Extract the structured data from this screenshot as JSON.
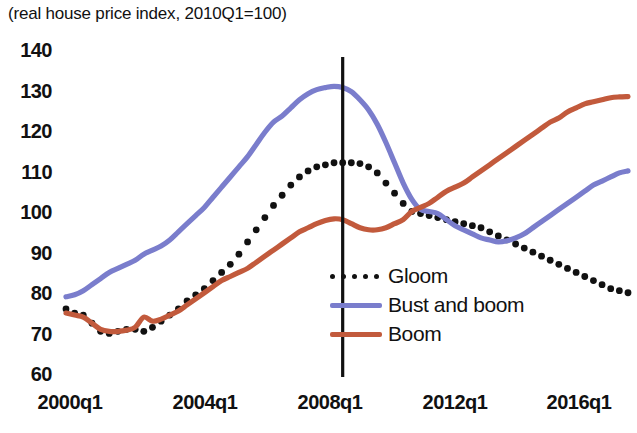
{
  "chart_data": {
    "type": "line",
    "title": "(real house price index, 2010Q1=100)",
    "xlabel": "",
    "ylabel": "",
    "ylim": [
      60,
      140
    ],
    "yticks": [
      140,
      130,
      120,
      110,
      100,
      90,
      80,
      70,
      60
    ],
    "xticks": [
      "2000q1",
      "2004q1",
      "2008q1",
      "2012q1",
      "2016q1"
    ],
    "xlim": [
      "2000q1",
      "2016q4"
    ],
    "grid": false,
    "legend_position": "center-right",
    "annotations": [
      {
        "type": "vline",
        "x": "2008q1",
        "label": "",
        "color": "#111111"
      }
    ],
    "x": [
      "2000q1",
      "2000q2",
      "2000q3",
      "2000q4",
      "2001q1",
      "2001q2",
      "2001q3",
      "2001q4",
      "2002q1",
      "2002q2",
      "2002q3",
      "2002q4",
      "2003q1",
      "2003q2",
      "2003q3",
      "2003q4",
      "2004q1",
      "2004q2",
      "2004q3",
      "2004q4",
      "2005q1",
      "2005q2",
      "2005q3",
      "2005q4",
      "2006q1",
      "2006q2",
      "2006q3",
      "2006q4",
      "2007q1",
      "2007q2",
      "2007q3",
      "2007q4",
      "2008q1",
      "2008q2",
      "2008q3",
      "2008q4",
      "2009q1",
      "2009q2",
      "2009q3",
      "2009q4",
      "2010q1",
      "2010q2",
      "2010q3",
      "2010q4",
      "2011q1",
      "2011q2",
      "2011q3",
      "2011q4",
      "2012q1",
      "2012q2",
      "2012q3",
      "2012q4",
      "2013q1",
      "2013q2",
      "2013q3",
      "2013q4",
      "2014q1",
      "2014q2",
      "2014q3",
      "2014q4",
      "2015q1",
      "2015q2",
      "2015q3",
      "2015q4",
      "2016q1",
      "2016q2"
    ],
    "series": [
      {
        "name": "Gloom",
        "color": "#111111",
        "style": "dotted",
        "values": [
          76.0,
          75.0,
          74.5,
          72.5,
          70.5,
          70.0,
          70.5,
          71.0,
          71.0,
          70.5,
          71.5,
          73.0,
          74.5,
          76.0,
          78.0,
          79.5,
          81.0,
          83.0,
          85.0,
          87.0,
          89.5,
          92.5,
          95.5,
          98.5,
          101.5,
          104.0,
          106.5,
          108.5,
          110.0,
          111.0,
          111.5,
          112.0,
          112.0,
          112.0,
          111.8,
          111.0,
          109.5,
          107.0,
          104.5,
          102.0,
          100.0,
          99.5,
          99.0,
          98.5,
          98.0,
          97.5,
          97.0,
          96.5,
          96.0,
          95.0,
          94.0,
          93.0,
          92.0,
          91.0,
          90.0,
          89.0,
          88.0,
          87.0,
          86.0,
          85.0,
          84.0,
          83.0,
          82.0,
          81.0,
          80.5,
          80.0
        ]
      },
      {
        "name": "Bust and boom",
        "color": "#7A7DCC",
        "style": "solid",
        "values": [
          79.0,
          79.5,
          80.5,
          82.0,
          83.5,
          85.0,
          86.0,
          87.0,
          88.0,
          89.5,
          90.5,
          91.5,
          93.0,
          95.0,
          97.0,
          99.0,
          101.0,
          103.5,
          106.0,
          108.5,
          111.0,
          113.5,
          116.5,
          119.5,
          122.0,
          123.5,
          125.5,
          127.5,
          129.0,
          130.0,
          130.5,
          130.8,
          130.5,
          129.5,
          127.5,
          125.0,
          121.5,
          117.0,
          112.0,
          107.0,
          103.0,
          100.5,
          100.0,
          99.5,
          98.0,
          96.5,
          95.5,
          94.5,
          93.5,
          93.0,
          92.5,
          92.8,
          93.5,
          94.5,
          96.0,
          97.5,
          99.0,
          100.5,
          102.0,
          103.5,
          105.0,
          106.5,
          107.5,
          108.5,
          109.5,
          110.0
        ]
      },
      {
        "name": "Boom",
        "color": "#C25A3C",
        "style": "solid",
        "values": [
          75.0,
          74.5,
          74.0,
          72.5,
          71.0,
          70.5,
          70.5,
          70.8,
          71.5,
          74.0,
          73.0,
          73.5,
          74.5,
          75.5,
          77.0,
          78.5,
          80.0,
          81.5,
          83.0,
          84.0,
          85.0,
          86.0,
          87.5,
          89.0,
          90.5,
          92.0,
          93.5,
          95.0,
          96.0,
          97.0,
          97.8,
          98.2,
          98.0,
          97.0,
          96.0,
          95.5,
          95.5,
          96.0,
          97.0,
          98.0,
          100.0,
          101.0,
          102.0,
          103.5,
          105.0,
          106.0,
          107.0,
          108.5,
          110.0,
          111.5,
          113.0,
          114.5,
          116.0,
          117.5,
          119.0,
          120.5,
          122.0,
          123.0,
          124.5,
          125.5,
          126.5,
          127.0,
          127.5,
          128.0,
          128.2,
          128.3
        ]
      }
    ]
  },
  "legend": {
    "items": [
      {
        "label": "Gloom",
        "swatch": "dotted-line-swatch",
        "color": "#111111"
      },
      {
        "label": "Bust and boom",
        "swatch": "solid-line-swatch",
        "color": "#7A7DCC"
      },
      {
        "label": "Boom",
        "swatch": "solid-line-swatch",
        "color": "#C25A3C"
      }
    ]
  },
  "axes": {
    "y_labels": [
      "140",
      "130",
      "120",
      "110",
      "100",
      "90",
      "80",
      "70",
      "60"
    ],
    "x_labels": [
      "2000q1",
      "2004q1",
      "2008q1",
      "2012q1",
      "2016q1"
    ]
  }
}
